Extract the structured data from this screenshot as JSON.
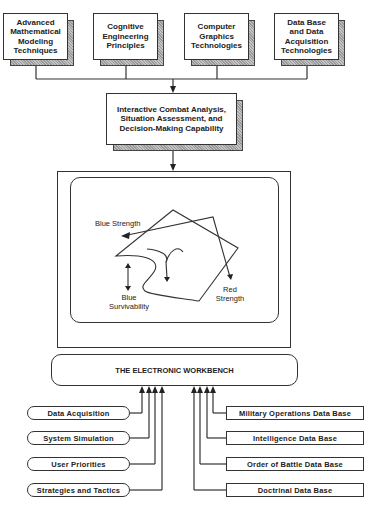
{
  "top_boxes": [
    {
      "label": "Advanced Mathematical Modeling Techniques"
    },
    {
      "label": "Cognitive Engineering Principles"
    },
    {
      "label": "Computer Graphics Technologies"
    },
    {
      "label": "Data Base and Data Acquisition Technologies"
    }
  ],
  "central_box": {
    "label": "Interactive Combat Analysis, Situation Assessment, and Decision-Making Capability"
  },
  "monitor": {
    "labels": {
      "blue_strength": "Blue Strength",
      "blue_survivability": "Blue Survivability",
      "red_strength": "Red Strength"
    }
  },
  "workbench": {
    "label": "THE ELECTRONIC WORKBENCH"
  },
  "left_inputs": [
    {
      "label": "Data Acquisition"
    },
    {
      "label": "System Simulation"
    },
    {
      "label": "User Priorities"
    },
    {
      "label": "Strategies and Tactics"
    }
  ],
  "right_inputs": [
    {
      "label": "Military Operations Data Base"
    },
    {
      "label": "Intelligence Data Base"
    },
    {
      "label": "Order of Battle Data Base"
    },
    {
      "label": "Doctrinal Data Base"
    }
  ]
}
